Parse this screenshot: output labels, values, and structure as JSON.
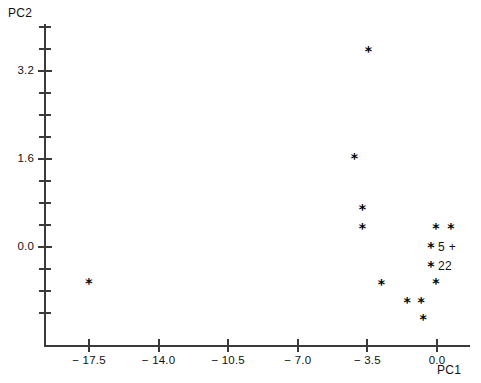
{
  "chart_data": {
    "type": "scatter",
    "title": "",
    "xlabel": "PC1",
    "ylabel": "PC2",
    "xlim": [
      -19.6,
      -0.3
    ],
    "ylim": [
      -1.4,
      4.1
    ],
    "grid": false,
    "legend": null,
    "marker": "*",
    "x_major_ticks": [
      -17.5,
      -14.0,
      -10.5,
      -7.0,
      -3.5,
      0.0
    ],
    "x_major_tick_labels": [
      "− 17.5",
      "− 14.0",
      "− 10.5",
      "− 7.0",
      "− 3.5",
      "0.0"
    ],
    "x_minor_ticks": [
      -19.25,
      -15.75,
      -12.25,
      -8.75,
      -5.25,
      -1.75
    ],
    "y_major_ticks": [
      3.2,
      1.6,
      0.0
    ],
    "y_major_tick_labels": [
      "3.2",
      "1.6",
      "0.0"
    ],
    "y_minor_ticks": [
      4.0,
      3.6,
      2.8,
      2.4,
      2.0,
      1.2,
      0.8,
      0.4,
      -0.4,
      -0.8,
      -1.2
    ],
    "points": [
      {
        "x": -3.45,
        "y": 3.57,
        "label": ""
      },
      {
        "x": -4.15,
        "y": 1.62,
        "label": ""
      },
      {
        "x": -3.75,
        "y": 0.69,
        "label": ""
      },
      {
        "x": -3.75,
        "y": 0.35,
        "label": ""
      },
      {
        "x": -0.05,
        "y": 0.35,
        "label": ""
      },
      {
        "x": 0.7,
        "y": 0.35,
        "label": ""
      },
      {
        "x": -0.3,
        "y": 0.0,
        "label": "5 +"
      },
      {
        "x": -0.3,
        "y": -0.35,
        "label": "22"
      },
      {
        "x": -17.5,
        "y": -0.65,
        "label": ""
      },
      {
        "x": -2.8,
        "y": -0.67,
        "label": ""
      },
      {
        "x": -0.05,
        "y": -0.65,
        "label": ""
      },
      {
        "x": -1.5,
        "y": -1.0,
        "label": ""
      },
      {
        "x": -0.8,
        "y": -1.0,
        "label": ""
      },
      {
        "x": -0.7,
        "y": -1.31,
        "label": ""
      }
    ]
  },
  "axes": {
    "x_title": "PC1",
    "y_title": "PC2"
  },
  "colors": {
    "axis": "#3a3a3a",
    "text": "#111111",
    "marker": "#000000",
    "background": "#ffffff"
  }
}
